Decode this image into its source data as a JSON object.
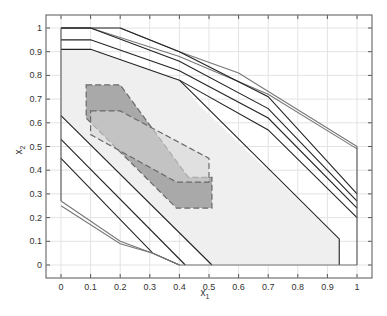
{
  "chart_data": {
    "type": "line",
    "title": "",
    "xlabel": "x1",
    "ylabel": "x2",
    "xlim": [
      -0.05,
      1.05
    ],
    "ylim": [
      -0.05,
      1.05
    ],
    "grid": true,
    "legend": null,
    "x_ticks": [
      "0",
      "0.1",
      "0.2",
      "0.3",
      "0.4",
      "0.5",
      "0.6",
      "0.7",
      "0.8",
      "0.9",
      "1"
    ],
    "y_ticks": [
      "0",
      "0.1",
      "0.2",
      "0.3",
      "0.4",
      "0.5",
      "0.6",
      "0.7",
      "0.8",
      "0.9",
      "1"
    ],
    "regions": [
      {
        "name": "light-feasible-region",
        "fill": "#efefef",
        "stroke": "none",
        "points": [
          [
            0,
            0.91
          ],
          [
            0.1,
            0.91
          ],
          [
            0.4,
            0.78
          ],
          [
            0.47,
            0.67
          ],
          [
            0.94,
            0.11
          ],
          [
            0.94,
            0
          ],
          [
            0.51,
            0
          ],
          [
            0,
            0.63
          ]
        ]
      },
      {
        "name": "dark-dashed-region",
        "fill": "#a9a9a9",
        "stroke": "#6a6a6a",
        "dashed": true,
        "points": [
          [
            0.085,
            0.76
          ],
          [
            0.2,
            0.76
          ],
          [
            0.43,
            0.37
          ],
          [
            0.51,
            0.37
          ],
          [
            0.51,
            0.24
          ],
          [
            0.39,
            0.24
          ],
          [
            0.085,
            0.62
          ]
        ]
      },
      {
        "name": "light-dashed-region",
        "fill": "#d6d6d6",
        "stroke": "#6a6a6a",
        "dashed": true,
        "opacity": 0.6,
        "points": [
          [
            0.1,
            0.65
          ],
          [
            0.2,
            0.65
          ],
          [
            0.5,
            0.45
          ],
          [
            0.5,
            0.35
          ],
          [
            0.39,
            0.35
          ],
          [
            0.1,
            0.55
          ]
        ]
      }
    ],
    "series": [
      {
        "name": "upper-gray-1",
        "color": "#777",
        "points": [
          [
            0,
            1
          ],
          [
            0.1,
            1
          ],
          [
            0.4,
            0.88
          ],
          [
            0.7,
            0.72
          ],
          [
            1,
            0.49
          ]
        ]
      },
      {
        "name": "upper-gray-2",
        "color": "#777",
        "points": [
          [
            0.2,
            1
          ],
          [
            0.4,
            0.9
          ],
          [
            0.6,
            0.81
          ],
          [
            1,
            0.5
          ]
        ]
      },
      {
        "name": "upper-1",
        "color": "#222",
        "points": [
          [
            0,
            1
          ],
          [
            0.2,
            1
          ],
          [
            0.4,
            0.9
          ],
          [
            0.7,
            0.71
          ],
          [
            1,
            0.3
          ]
        ]
      },
      {
        "name": "upper-2",
        "color": "#222",
        "points": [
          [
            0,
            1
          ],
          [
            0.1,
            1
          ],
          [
            0.4,
            0.86
          ],
          [
            0.7,
            0.66
          ],
          [
            1,
            0.27
          ]
        ]
      },
      {
        "name": "upper-3",
        "color": "#222",
        "points": [
          [
            0,
            0.95
          ],
          [
            0.1,
            0.95
          ],
          [
            0.4,
            0.82
          ],
          [
            0.7,
            0.62
          ],
          [
            1,
            0.24
          ]
        ]
      },
      {
        "name": "upper-4",
        "color": "#222",
        "points": [
          [
            0,
            0.91
          ],
          [
            0.1,
            0.91
          ],
          [
            0.4,
            0.78
          ],
          [
            0.7,
            0.57
          ],
          [
            1,
            0.2
          ]
        ]
      },
      {
        "name": "right-boundary",
        "color": "#222",
        "points": [
          [
            0.4,
            0.78
          ],
          [
            0.94,
            0.11
          ],
          [
            0.94,
            0
          ]
        ]
      },
      {
        "name": "diag-1",
        "color": "#222",
        "points": [
          [
            0,
            0.63
          ],
          [
            0.51,
            0
          ]
        ]
      },
      {
        "name": "diag-2",
        "color": "#222",
        "points": [
          [
            0,
            0.53
          ],
          [
            0.42,
            0
          ]
        ]
      },
      {
        "name": "diag-3",
        "color": "#222",
        "points": [
          [
            0,
            0.45
          ],
          [
            0.31,
            0.05
          ],
          [
            0.4,
            0
          ]
        ]
      },
      {
        "name": "lower-gray-1",
        "color": "#777",
        "points": [
          [
            0,
            0.27
          ],
          [
            0.2,
            0.1
          ],
          [
            0.31,
            0.05
          ],
          [
            0.4,
            0
          ],
          [
            1,
            0
          ]
        ]
      },
      {
        "name": "lower-gray-2",
        "color": "#777",
        "points": [
          [
            0,
            0.25
          ],
          [
            0.2,
            0.09
          ],
          [
            0.31,
            0.05
          ],
          [
            0.4,
            0
          ]
        ]
      },
      {
        "name": "left-boundary",
        "color": "#555",
        "points": [
          [
            0,
            0.27
          ],
          [
            0,
            1
          ]
        ]
      },
      {
        "name": "right-edge",
        "color": "#555",
        "points": [
          [
            1,
            0
          ],
          [
            1,
            0.5
          ]
        ]
      }
    ]
  },
  "axes": {
    "xlabel_main": "x",
    "xlabel_sub": "1",
    "ylabel_main": "x",
    "ylabel_sub": "2"
  }
}
